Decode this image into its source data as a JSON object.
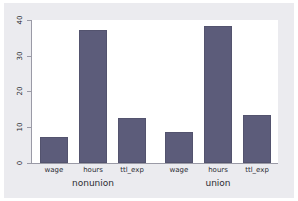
{
  "chart_data": {
    "type": "bar",
    "title": "",
    "subtitle": "",
    "xlabel": "",
    "ylabel": "",
    "ylim": [
      0,
      40
    ],
    "yticks": [
      "0",
      "10",
      "20",
      "30",
      "40"
    ],
    "ytick_values": [
      0,
      10,
      20,
      30,
      40
    ],
    "grid": false,
    "legend_position": "none",
    "orientation": "vertical",
    "groups": [
      "nonunion",
      "union"
    ],
    "categories": [
      "wage",
      "hours",
      "ttl_exp"
    ],
    "series": [
      {
        "name": "nonunion",
        "values": [
          7.3,
          37.2,
          12.6
        ]
      },
      {
        "name": "union",
        "values": [
          8.7,
          38.4,
          13.3
        ]
      }
    ],
    "bars": [
      {
        "group": "nonunion",
        "category": "wage",
        "value": 7.3
      },
      {
        "group": "nonunion",
        "category": "hours",
        "value": 37.2
      },
      {
        "group": "nonunion",
        "category": "ttl_exp",
        "value": 12.6
      },
      {
        "group": "union",
        "category": "wage",
        "value": 8.7
      },
      {
        "group": "union",
        "category": "hours",
        "value": 38.4
      },
      {
        "group": "union",
        "category": "ttl_exp",
        "value": 13.3
      }
    ],
    "colors": {
      "bar_fill": "#5c5c7a",
      "bar_border": "#53536e",
      "plot_background": "#ffffff",
      "graph_background": "#ebebef",
      "axis": "#9a9aa6",
      "text": "#2b2b33"
    }
  },
  "axis": {
    "ytick_labels": [
      "0",
      "10",
      "20",
      "30",
      "40"
    ]
  },
  "labels": {
    "cat_0": "wage",
    "cat_1": "hours",
    "cat_2": "ttl_exp",
    "cat_3": "wage",
    "cat_4": "hours",
    "cat_5": "ttl_exp",
    "group_0": "nonunion",
    "group_1": "union"
  }
}
